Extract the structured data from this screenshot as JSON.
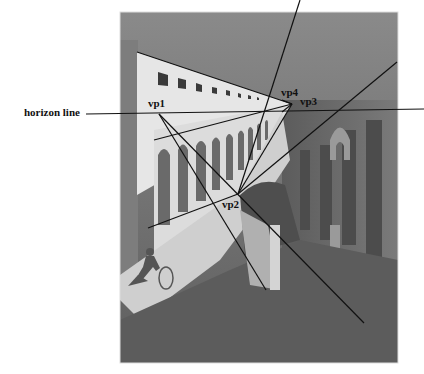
{
  "figure": {
    "labels": {
      "horizon": "horizon line",
      "vp1": "vp1",
      "vp2": "vp2",
      "vp3": "vp3",
      "vp4": "vp4"
    },
    "colors": {
      "line": "#111111",
      "sky": "#6e6e6e",
      "wall_light": "#e4e4e4",
      "street_light": "#c8c8c8",
      "shadow": "#5a5a5a"
    }
  }
}
